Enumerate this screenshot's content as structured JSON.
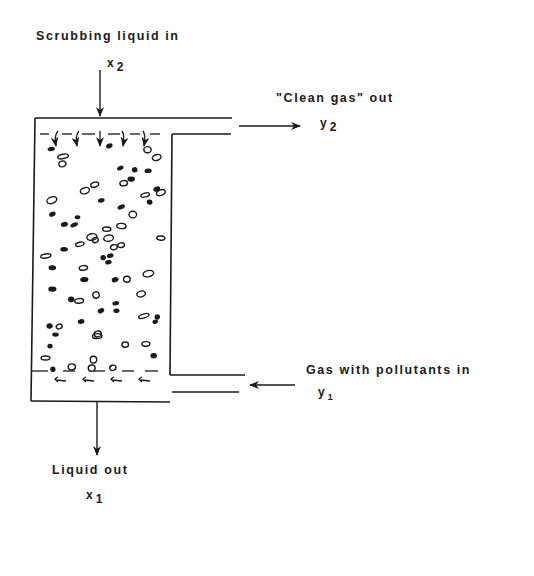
{
  "diagram": {
    "type": "packed-bed counter-current scrubber (absorption column)",
    "stroke_color": "#1a1a1a",
    "background": "#ffffff",
    "streams": {
      "liquid_in": {
        "label": "Scrubbing liquid in",
        "var": "x",
        "sub": "2"
      },
      "gas_out": {
        "label": "\"Clean gas\" out",
        "var": "y",
        "sub": "2"
      },
      "gas_in": {
        "label": "Gas with pollutants in",
        "var": "y",
        "sub": "1"
      },
      "liquid_out": {
        "label": "Liquid out",
        "var": "x",
        "sub": "1"
      }
    }
  }
}
